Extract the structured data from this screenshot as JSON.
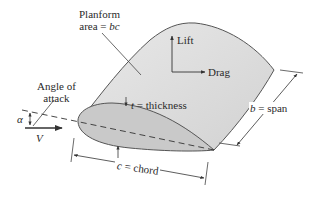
{
  "figure": {
    "type": "wing-geometry-diagram",
    "colors": {
      "wing_surface": "#dcdcdc",
      "airfoil_section": "#c8c8c8",
      "outline": "#555555",
      "text": "#2a2a2a"
    }
  },
  "labels": {
    "planform_line1": "Planform",
    "planform_line2_prefix": "area = ",
    "planform_line2_var": "bc",
    "angle_line1": "Angle of",
    "angle_line2": "attack",
    "alpha": "α",
    "velocity": "V",
    "lift": "Lift",
    "drag": "Drag",
    "thickness_var": "t",
    "thickness_suffix": " = thickness",
    "span_var": "b",
    "span_suffix": " = span",
    "chord_var": "c",
    "chord_suffix": " = chord"
  }
}
